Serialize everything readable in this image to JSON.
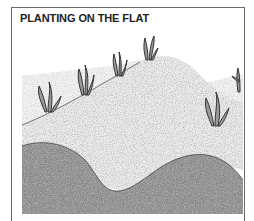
{
  "figure": {
    "title": "PLANTING ON THE FLAT",
    "illustration": {
      "subject": "raised soil mounds with plants growing on flat ground",
      "elements": [
        "flat-ground",
        "soil-mound",
        "dark-soil-foreground",
        "plant-clumps"
      ],
      "plant_count": 6
    },
    "colors": {
      "frame": "#6a6a6a",
      "title": "#222222",
      "light_soil": "#e4e4e4",
      "dark_soil": "#8a8a8a",
      "plant_ink": "#333333"
    }
  }
}
